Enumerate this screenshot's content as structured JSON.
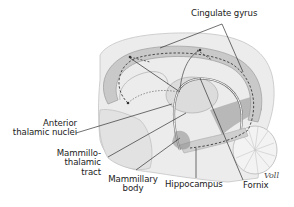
{
  "diagram": {
    "labels": {
      "cingulate_gyrus": "Cingulate gyrus",
      "anterior_thalamic_nuclei_line1": "Anterior",
      "anterior_thalamic_nuclei_line2": "thalamic nuclei",
      "mammillothalamic_line1": "Mammillo-",
      "mammillothalamic_line2": "thalamic",
      "mammillothalamic_line3": "tract",
      "mammillary_line1": "Mammillary",
      "mammillary_line2": "body",
      "hippocampus": "Hippocampus",
      "fornix": "Fornix"
    },
    "signature": "Voll",
    "colors": {
      "background": "#ffffff",
      "label_text": "#222222",
      "leader_line": "#333333",
      "brain_fill": "#e6e6e6",
      "gyrus_band": "#c8c8c8",
      "dashed_path": "#3a3a3a"
    }
  }
}
